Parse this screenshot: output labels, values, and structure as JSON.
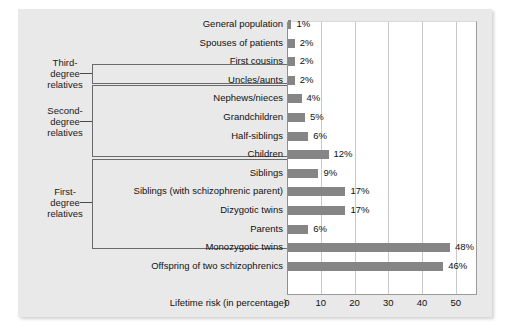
{
  "chart_data": {
    "type": "bar",
    "orientation": "horizontal",
    "title": "",
    "xlabel": "Lifetime risk (in percentage)",
    "ylabel": "",
    "xlim": [
      0,
      56
    ],
    "xticks": [
      0,
      10,
      20,
      30,
      40,
      50
    ],
    "grid": true,
    "legend": "none",
    "categories": [
      "General population",
      "Spouses of patients",
      "First cousins",
      "Uncles/aunts",
      "Nephews/nieces",
      "Grandchildren",
      "Half-siblings",
      "Children",
      "Siblings",
      "Siblings (with schizophrenic parent)",
      "Dizygotic twins",
      "Parents",
      "Monozygotic twins",
      "Offspring of two schizophrenics"
    ],
    "values": [
      1,
      2,
      2,
      2,
      4,
      5,
      6,
      12,
      9,
      17,
      17,
      6,
      48,
      46
    ],
    "value_labels": [
      "1%",
      "2%",
      "2%",
      "2%",
      "4%",
      "5%",
      "6%",
      "12%",
      "9%",
      "17%",
      "17%",
      "6%",
      "48%",
      "46%"
    ],
    "bar_color": "#858585",
    "plot_background": "#ffffff",
    "figure_background": "#e9e9e9"
  },
  "groups": [
    {
      "label": "Third-\ndegree\nrelatives",
      "line1": "Third-",
      "line2": "degree",
      "line3": "relatives",
      "first_row": 2,
      "last_row": 2
    },
    {
      "label": "Second-\ndegree\nrelatives",
      "line1": "Second-",
      "line2": "degree",
      "line3": "relatives",
      "first_row": 3,
      "last_row": 6
    },
    {
      "label": "First-\ndegree\nrelatives",
      "line1": "First-",
      "line2": "degree",
      "line3": "relatives",
      "first_row": 7,
      "last_row": 11
    }
  ],
  "axis": {
    "title": "Lifetime risk (in percentage)",
    "ticks": [
      "0",
      "10",
      "20",
      "30",
      "40",
      "50"
    ]
  }
}
